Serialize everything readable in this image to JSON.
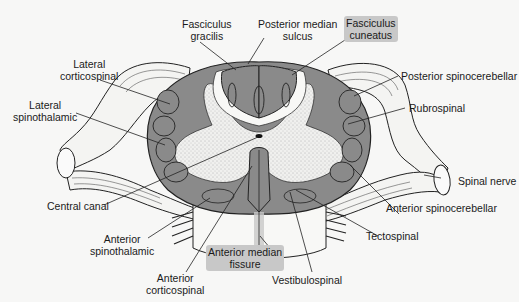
{
  "diagram": {
    "type": "anatomical cross-section",
    "colors": {
      "white_matter_tract": "#8a8a8a",
      "tract_outline": "#333333",
      "gray_matter_stipple": "#e6e6e6",
      "background": "#f7f7f6",
      "highlight": "#c8c8c8"
    },
    "labels": {
      "fasciculus_gracilis": [
        "Fasciculus",
        "gracilis"
      ],
      "posterior_median_sulcus": [
        "Posterior median",
        "sulcus"
      ],
      "fasciculus_cuneatus": [
        "Fasciculus",
        "cuneatus"
      ],
      "lateral_corticospinal": [
        "Lateral",
        "corticospinal"
      ],
      "lateral_spinothalamic": [
        "Lateral",
        "spinothalamic"
      ],
      "posterior_spinocerebellar": "Posterior spinocerebellar",
      "rubrospinal": "Rubrospinal",
      "spinal_nerve": "Spinal nerve",
      "central_canal": "Central canal",
      "anterior_spinocerebellar": "Anterior spinocerebellar",
      "tectospinal": "Tectospinal",
      "anterior_spinothalamic": [
        "Anterior",
        "spinothalamic"
      ],
      "anterior_median_fissure": [
        "Anterior median",
        "fissure"
      ],
      "anterior_corticospinal": [
        "Anterior",
        "corticospinal"
      ],
      "vestibulospinal": "Vestibulospinal"
    },
    "highlighted_labels": [
      "Fasciculus cuneatus",
      "Anterior median fissure"
    ]
  }
}
